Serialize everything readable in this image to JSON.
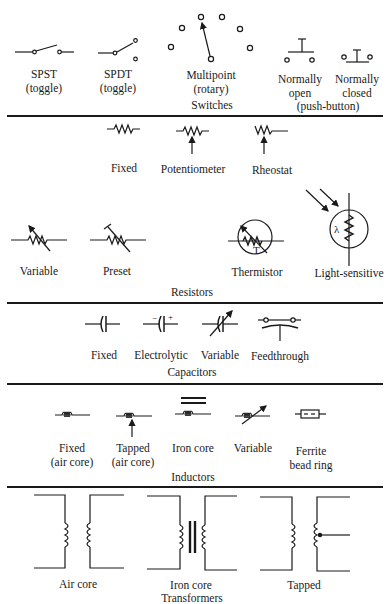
{
  "switches": {
    "title": "Switches",
    "group_label": "(push-button)",
    "items": [
      {
        "name": "SPST",
        "sub": "(toggle)"
      },
      {
        "name": "SPDT",
        "sub": "(toggle)"
      },
      {
        "name": "Multipoint",
        "sub": "(rotary)"
      },
      {
        "name": "Normally",
        "sub": "open"
      },
      {
        "name": "Normally",
        "sub": "closed"
      }
    ]
  },
  "resistors": {
    "title": "Resistors",
    "items": [
      {
        "name": "Fixed"
      },
      {
        "name": "Potentiometer"
      },
      {
        "name": "Rheostat"
      },
      {
        "name": "Variable"
      },
      {
        "name": "Preset"
      },
      {
        "name": "Thermistor",
        "symbol_text": "T"
      },
      {
        "name": "Light-sensitive",
        "symbol_text": "λ"
      }
    ]
  },
  "capacitors": {
    "title": "Capacitors",
    "items": [
      {
        "name": "Fixed"
      },
      {
        "name": "Electrolytic",
        "minus": "−",
        "plus": "+"
      },
      {
        "name": "Variable"
      },
      {
        "name": "Feedthrough"
      }
    ]
  },
  "inductors": {
    "title": "Inductors",
    "items": [
      {
        "name": "Fixed",
        "sub": "(air core)"
      },
      {
        "name": "Tapped",
        "sub": "(air core)"
      },
      {
        "name": "Iron core"
      },
      {
        "name": "Variable"
      },
      {
        "name": "Ferrite",
        "sub": "bead ring"
      }
    ]
  },
  "transformers": {
    "title": "Transformers",
    "items": [
      {
        "name": "Air core"
      },
      {
        "name": "Iron core"
      },
      {
        "name": "Tapped"
      }
    ]
  },
  "colors": {
    "ink": "#1a1a1a",
    "background": "#ffffff"
  }
}
